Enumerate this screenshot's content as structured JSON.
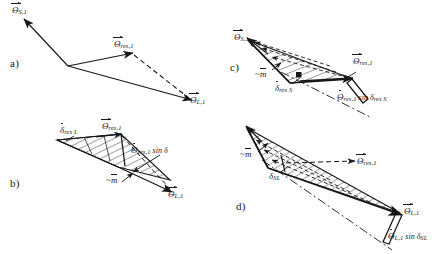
{
  "figure": {
    "background": "#ffffff",
    "ink_color": "#17171a",
    "width": 438,
    "height": 254
  },
  "panels": [
    {
      "id": "a",
      "letter": "a)",
      "description": "Open vector triangle: theta_S,1 and theta_L,1 solid arrows meeting at a vertex, resultant theta_res,1 solid arrow with dashed closing line to theta_L,1",
      "labels": [
        {
          "name": "theta-s1",
          "base": "Θ",
          "accent": "vector",
          "sub": "S,1",
          "op": ""
        },
        {
          "name": "theta-res1",
          "base": "Θ",
          "accent": "vector",
          "sub": "res,1",
          "op": ""
        },
        {
          "name": "theta-l1",
          "base": "Θ",
          "accent": "vector",
          "sub": "L,1",
          "op": ""
        }
      ]
    },
    {
      "id": "b",
      "letter": "b)",
      "description": "Hatched wedge swept region between theta_res,1 and theta_L,1 with mass axis ~m",
      "labels": [
        {
          "name": "delta-res-l",
          "base": "δ",
          "accent": "dot",
          "sub": "res L",
          "op": ""
        },
        {
          "name": "theta-res1",
          "base": "Θ",
          "accent": "vector",
          "sub": "res,1",
          "op": ""
        },
        {
          "name": "theta-res1-sin-delta",
          "base": "Θ",
          "accent": "dot",
          "sub": "res,1",
          "op": " sin δ"
        },
        {
          "name": "tilde-m",
          "base": "m",
          "accent": "overbar",
          "sub": "",
          "op": "",
          "prefix": "~"
        },
        {
          "name": "theta-l1",
          "base": "Θ",
          "accent": "vector",
          "sub": "L,1",
          "op": ""
        }
      ]
    },
    {
      "id": "c",
      "letter": "c)",
      "description": "Hatched triangular cone from theta_S,1 toward theta_res,1 with dash-dot axis and a narrow parallelogram strip labelled theta_res,1 sin delta_res S",
      "labels": [
        {
          "name": "theta-s1",
          "base": "Θ",
          "accent": "vector",
          "sub": "S,1",
          "op": ""
        },
        {
          "name": "tilde-m",
          "base": "m",
          "accent": "overbar",
          "sub": "",
          "op": "",
          "prefix": "~"
        },
        {
          "name": "delta-res-s",
          "base": "δ",
          "accent": "dot",
          "sub": "res S",
          "op": ""
        },
        {
          "name": "theta-res1",
          "base": "Θ",
          "accent": "vector",
          "sub": "res,1",
          "op": ""
        },
        {
          "name": "theta-res1-sin-delta-res-s",
          "base": "Θ",
          "accent": "dot",
          "sub": "res,1",
          "op": " sin δ",
          "op_sub": "res S"
        }
      ]
    },
    {
      "id": "d",
      "letter": "d)",
      "description": "Long hatched sliver from the upper-left apex down to theta_L,1 with dash-dot axis and a narrow parallelogram strip labelled theta_L,1 sin delta_SL",
      "labels": [
        {
          "name": "tilde-m",
          "base": "m",
          "accent": "overbar",
          "sub": "",
          "op": "",
          "prefix": "~"
        },
        {
          "name": "delta-sl",
          "base": "δ",
          "accent": "dot",
          "sub": "SL",
          "op": ""
        },
        {
          "name": "theta-res1",
          "base": "Θ",
          "accent": "vector",
          "sub": "res,1",
          "op": ""
        },
        {
          "name": "theta-l1",
          "base": "Θ",
          "accent": "vector",
          "sub": "L,1",
          "op": ""
        },
        {
          "name": "theta-l1-sin-delta-sl",
          "base": "Θ",
          "accent": "dot",
          "sub": "L,1",
          "op": " sin δ",
          "op_sub": "SL"
        }
      ]
    }
  ],
  "text": {
    "panel_a_letter": "a)",
    "panel_b_letter": "b)",
    "panel_c_letter": "c)",
    "panel_d_letter": "d)",
    "theta": "Θ",
    "delta": "δ",
    "tilde": "~",
    "m": "m",
    "sin": " sin ",
    "sub_s1": "S,1",
    "sub_res1": "res,1",
    "sub_l1": "L,1",
    "sub_res_l": "res L",
    "sub_res_s": "res S",
    "sub_sl": "SL",
    "sub_delta_plain": "δ"
  }
}
